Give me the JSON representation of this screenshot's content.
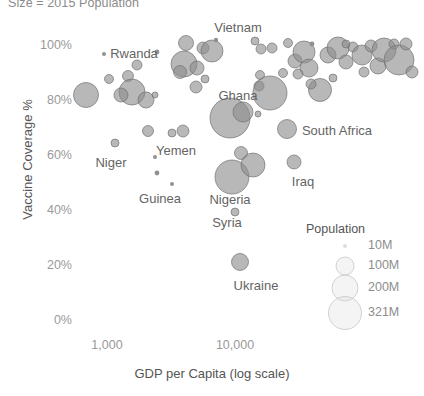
{
  "chart_data": {
    "type": "scatter",
    "title": "Size = 2015 Population",
    "xlabel": "GDP per Capita (log scale)",
    "ylabel": "Vaccine Coverage %",
    "grid": false,
    "xscale": "log",
    "xlim": [
      430,
      62000
    ],
    "ylim": [
      0,
      108
    ],
    "xticks": [
      "1,000",
      "10,000"
    ],
    "xtick_values": [
      1000,
      10000
    ],
    "yticks": [
      "0%",
      "20%",
      "40%",
      "60%",
      "80%",
      "100%"
    ],
    "ytick_values": [
      0,
      20,
      40,
      60,
      80,
      100
    ],
    "bubble_color": "#8c8c8c",
    "bubble_stroke": "#6e6e6e",
    "legend": {
      "title": "Population",
      "position": "bottom-right",
      "entries": [
        {
          "label": "10M",
          "value": 10
        },
        {
          "label": "100M",
          "value": 100
        },
        {
          "label": "200M",
          "value": 200
        },
        {
          "label": "321M",
          "value": 321
        }
      ]
    },
    "annotations": [
      {
        "text": "Vietnam",
        "x": 238,
        "y": 27
      },
      {
        "text": "Rwanda",
        "x": 134,
        "y": 53
      },
      {
        "text": "Ghana",
        "x": 238,
        "y": 95
      },
      {
        "text": "South Africa",
        "x": 337,
        "y": 130
      },
      {
        "text": "Niger",
        "x": 111,
        "y": 162
      },
      {
        "text": "Yemen",
        "x": 176,
        "y": 150
      },
      {
        "text": "Iraq",
        "x": 303,
        "y": 181
      },
      {
        "text": "Guinea",
        "x": 160,
        "y": 198
      },
      {
        "text": "Nigeria",
        "x": 230,
        "y": 199
      },
      {
        "text": "Syria",
        "x": 227,
        "y": 222
      },
      {
        "text": "Ukraine",
        "x": 256,
        "y": 285
      }
    ],
    "points": [
      {
        "cx": 104,
        "cy": 54,
        "r": 2.0
      },
      {
        "cx": 157,
        "cy": 52,
        "r": 2.4
      },
      {
        "cx": 86,
        "cy": 95,
        "r": 12.5
      },
      {
        "cx": 109,
        "cy": 79,
        "r": 4.5
      },
      {
        "cx": 128,
        "cy": 76,
        "r": 5.5
      },
      {
        "cx": 132,
        "cy": 92,
        "r": 13.0
      },
      {
        "cx": 137,
        "cy": 65,
        "r": 5.0
      },
      {
        "cx": 121,
        "cy": 95,
        "r": 7.0
      },
      {
        "cx": 146,
        "cy": 100,
        "r": 8.0
      },
      {
        "cx": 155,
        "cy": 95,
        "r": 3.0
      },
      {
        "cx": 184,
        "cy": 64,
        "r": 13.0
      },
      {
        "cx": 186,
        "cy": 43,
        "r": 7.5
      },
      {
        "cx": 180,
        "cy": 72,
        "r": 6.5
      },
      {
        "cx": 197,
        "cy": 68,
        "r": 7.0
      },
      {
        "cx": 203,
        "cy": 48,
        "r": 6.0
      },
      {
        "cx": 196,
        "cy": 87,
        "r": 6.0
      },
      {
        "cx": 212,
        "cy": 51,
        "r": 11.0
      },
      {
        "cx": 216,
        "cy": 40,
        "r": 2.2
      },
      {
        "cx": 205,
        "cy": 79,
        "r": 4.0
      },
      {
        "cx": 148,
        "cy": 131,
        "r": 5.5
      },
      {
        "cx": 172,
        "cy": 133,
        "r": 4.0
      },
      {
        "cx": 183,
        "cy": 131,
        "r": 6.0
      },
      {
        "cx": 115,
        "cy": 143,
        "r": 4.0
      },
      {
        "cx": 155,
        "cy": 157,
        "r": 2.0
      },
      {
        "cx": 157,
        "cy": 173,
        "r": 2.4
      },
      {
        "cx": 172,
        "cy": 184,
        "r": 2.0
      },
      {
        "cx": 230,
        "cy": 118,
        "r": 20.0
      },
      {
        "cx": 243,
        "cy": 112,
        "r": 10.0
      },
      {
        "cx": 241,
        "cy": 153,
        "r": 6.5
      },
      {
        "cx": 232,
        "cy": 177,
        "r": 17.0
      },
      {
        "cx": 253,
        "cy": 165,
        "r": 12.0
      },
      {
        "cx": 235,
        "cy": 212,
        "r": 4.0
      },
      {
        "cx": 240,
        "cy": 262,
        "r": 8.5
      },
      {
        "cx": 258,
        "cy": 114,
        "r": 3.0
      },
      {
        "cx": 260,
        "cy": 75,
        "r": 4.5
      },
      {
        "cx": 259,
        "cy": 86,
        "r": 5.0
      },
      {
        "cx": 270,
        "cy": 93,
        "r": 17.0
      },
      {
        "cx": 283,
        "cy": 73,
        "r": 4.5
      },
      {
        "cx": 261,
        "cy": 49,
        "r": 5.0
      },
      {
        "cx": 272,
        "cy": 48,
        "r": 5.0
      },
      {
        "cx": 288,
        "cy": 43,
        "r": 4.5
      },
      {
        "cx": 295,
        "cy": 61,
        "r": 7.0
      },
      {
        "cx": 304,
        "cy": 52,
        "r": 11.0
      },
      {
        "cx": 309,
        "cy": 68,
        "r": 9.0
      },
      {
        "cx": 298,
        "cy": 74,
        "r": 5.0
      },
      {
        "cx": 312,
        "cy": 44,
        "r": 2.4
      },
      {
        "cx": 287,
        "cy": 129,
        "r": 9.5
      },
      {
        "cx": 294,
        "cy": 162,
        "r": 7.0
      },
      {
        "cx": 320,
        "cy": 90,
        "r": 11.5
      },
      {
        "cx": 311,
        "cy": 84,
        "r": 5.0
      },
      {
        "cx": 333,
        "cy": 78,
        "r": 4.0
      },
      {
        "cx": 328,
        "cy": 55,
        "r": 8.0
      },
      {
        "cx": 338,
        "cy": 48,
        "r": 11.0
      },
      {
        "cx": 346,
        "cy": 62,
        "r": 7.0
      },
      {
        "cx": 353,
        "cy": 47,
        "r": 5.0
      },
      {
        "cx": 346,
        "cy": 44,
        "r": 4.0
      },
      {
        "cx": 362,
        "cy": 55,
        "r": 10.0
      },
      {
        "cx": 371,
        "cy": 46,
        "r": 6.0
      },
      {
        "cx": 364,
        "cy": 72,
        "r": 5.0
      },
      {
        "cx": 378,
        "cy": 66,
        "r": 8.0
      },
      {
        "cx": 384,
        "cy": 50,
        "r": 12.0
      },
      {
        "cx": 394,
        "cy": 44,
        "r": 5.0
      },
      {
        "cx": 399,
        "cy": 60,
        "r": 15.0
      },
      {
        "cx": 406,
        "cy": 44,
        "r": 6.0
      },
      {
        "cx": 412,
        "cy": 72,
        "r": 6.0
      },
      {
        "cx": 255,
        "cy": 41,
        "r": 4.0
      }
    ]
  }
}
